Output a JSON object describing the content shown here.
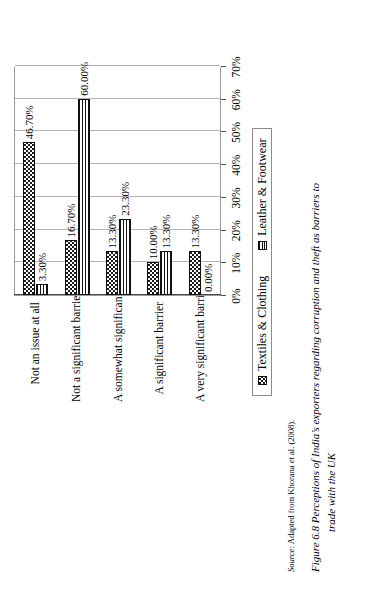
{
  "figure": {
    "caption_number": "Figure 6.8",
    "caption_line1": "Perceptions of India’s exporters regarding corruption and theft as barriers to",
    "caption_line2": "trade with the UK",
    "source_label": "Source:",
    "source_text": "Adapted from Khorana et al. (2008)."
  },
  "legend": {
    "position": "bottom",
    "items": [
      {
        "label": "Textiles & Clothing",
        "swatch": "dotted-square-icon",
        "pattern": "stipple",
        "color": "#111111"
      },
      {
        "label": "Leather & Footwear",
        "swatch": "striped-square-icon",
        "pattern": "horizontal-lines",
        "color": "#111111"
      }
    ]
  },
  "axis": {
    "tick_labels": [
      "0%",
      "10%",
      "20%",
      "30%",
      "40%",
      "50%",
      "60%",
      "70%"
    ],
    "min": 0,
    "max": 70,
    "step": 10
  },
  "chart_data": {
    "type": "bar",
    "orientation": "vertical",
    "title": "",
    "xlabel": "",
    "ylabel": "",
    "ylim": [
      0,
      70
    ],
    "grid": true,
    "legend_position": "bottom",
    "categories": [
      "Not an issue at all",
      "Not a significant barrier",
      "A somewhat significant barrier",
      "A significant barrier",
      "A very significant barrier"
    ],
    "series": [
      {
        "name": "Textiles & Clothing",
        "values": [
          46.7,
          16.7,
          13.3,
          10.0,
          13.3
        ],
        "labels": [
          "46.70%",
          "16.70%",
          "13.30%",
          "10.00%",
          "13.30%"
        ]
      },
      {
        "name": "Leather & Footwear",
        "values": [
          3.3,
          60.0,
          23.3,
          13.3,
          0.0
        ],
        "labels": [
          "3.30%",
          "60.00%",
          "23.30%",
          "13.30%",
          "0.00%"
        ]
      }
    ]
  }
}
